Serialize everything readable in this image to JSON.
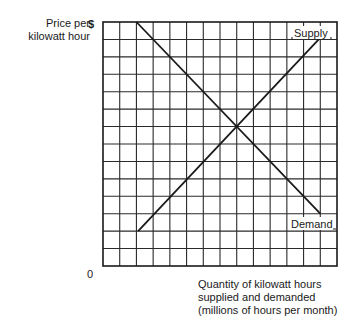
{
  "chart_data": {
    "type": "line",
    "title": "",
    "xlabel": "Quantity of kilowatt hours supplied and demanded (millions of hours per month)",
    "xlabel_lines": [
      "Quantity of kilowatt hours",
      "supplied and demanded",
      "(millions of hours per month)"
    ],
    "ylabel": "Price per kilowatt hour",
    "ylabel_lines": [
      "Price per",
      "kilowatt hour"
    ],
    "y_top_tick": "$",
    "origin_label": "0",
    "grid": true,
    "grid_cells": {
      "columns": 14,
      "rows": 14
    },
    "xlim": [
      0,
      14
    ],
    "ylim": [
      0,
      14
    ],
    "legend_position": "inline labels at line ends",
    "series": [
      {
        "name": "Supply",
        "points": [
          [
            2.1,
            2.0
          ],
          [
            13.4,
            13.5
          ]
        ],
        "slope": "upward"
      },
      {
        "name": "Demand",
        "points": [
          [
            2.0,
            14.0
          ],
          [
            13.0,
            3.0
          ]
        ],
        "slope": "downward"
      }
    ],
    "equilibrium": {
      "x": 8.0,
      "y": 8.0
    }
  },
  "labels": {
    "y_axis_line1": "Price per",
    "y_axis_line2": "kilowatt hour",
    "y_top": "$",
    "origin": "0",
    "x_axis_line1": "Quantity of kilowatt hours",
    "x_axis_line2": "supplied and demanded",
    "x_axis_line3": "(millions of hours per month)",
    "supply": "Supply",
    "demand": "Demand"
  }
}
